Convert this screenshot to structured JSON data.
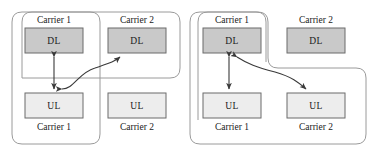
{
  "figure": {
    "title": "",
    "width": 378,
    "height": 156,
    "background": "#ffffff",
    "colors": {
      "dl_fill": "#c9c9c9",
      "ul_fill": "#ededed",
      "box_stroke": "#6b6b6b",
      "group_stroke": "#9a9a9a",
      "arrow_stroke": "#3a3a3a",
      "text": "#1a1a1a"
    }
  },
  "panels": [
    {
      "id": "left-panel",
      "name": "left-diagram",
      "boxes": [
        {
          "id": "left-dl1",
          "label": "DL",
          "kind": "dl"
        },
        {
          "id": "left-dl2",
          "label": "DL",
          "kind": "dl"
        },
        {
          "id": "left-ul1",
          "label": "UL",
          "kind": "ul"
        },
        {
          "id": "left-ul2",
          "label": "UL",
          "kind": "ul"
        }
      ],
      "top_labels": [
        {
          "id": "left-top-carrier1",
          "label": "Carrier 1"
        },
        {
          "id": "left-top-carrier2",
          "label": "Carrier 2"
        }
      ],
      "bottom_labels": [
        {
          "id": "left-bottom-carrier1",
          "label": "Carrier 1"
        },
        {
          "id": "left-bottom-carrier2",
          "label": "Carrier 2"
        }
      ],
      "connections": [
        {
          "id": "left-conn-dl1-ul1",
          "from": "DL Carrier 1",
          "to": "UL Carrier 1",
          "arrows": "both",
          "shape": "straight"
        },
        {
          "id": "left-conn-ul1-dl2",
          "from": "UL Carrier 1",
          "to": "DL Carrier 2",
          "arrows": "both",
          "shape": "s-curve"
        }
      ],
      "groups": [
        {
          "id": "left-group-a",
          "name": "carrier1-dl-carrier2-dl-group"
        },
        {
          "id": "left-group-b",
          "name": "carrier1-dl-carrier1-ul-group"
        }
      ]
    },
    {
      "id": "right-panel",
      "name": "right-diagram",
      "boxes": [
        {
          "id": "right-dl1",
          "label": "DL",
          "kind": "dl"
        },
        {
          "id": "right-dl2",
          "label": "DL",
          "kind": "dl"
        },
        {
          "id": "right-ul1",
          "label": "UL",
          "kind": "ul"
        },
        {
          "id": "right-ul2",
          "label": "UL",
          "kind": "ul"
        }
      ],
      "top_labels": [
        {
          "id": "right-top-carrier1",
          "label": "Carrier 1"
        },
        {
          "id": "right-top-carrier2",
          "label": "Carrier 2"
        }
      ],
      "bottom_labels": [
        {
          "id": "right-bottom-carrier1",
          "label": "Carrier 1"
        },
        {
          "id": "right-bottom-carrier2",
          "label": "Carrier 2"
        }
      ],
      "connections": [
        {
          "id": "right-conn-dl1-ul1",
          "from": "DL Carrier 1",
          "to": "UL Carrier 1",
          "arrows": "both",
          "shape": "straight"
        },
        {
          "id": "right-conn-dl1-ul2",
          "from": "DL Carrier 1",
          "to": "UL Carrier 2",
          "arrows": "both",
          "shape": "s-curve"
        }
      ],
      "groups": [
        {
          "id": "right-group-a",
          "name": "carrier1-dl-carrier1-ul-group"
        },
        {
          "id": "right-group-b",
          "name": "carrier1-dl-carrier1-ul-carrier2-ul-group"
        }
      ]
    }
  ]
}
